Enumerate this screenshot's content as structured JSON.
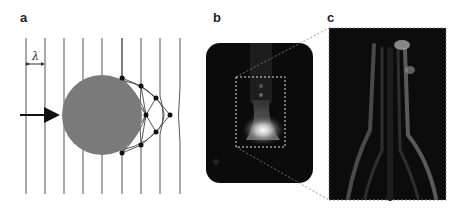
{
  "figure": {
    "panels": [
      {
        "label": "a",
        "description": "Plane wavefronts diffracting around a circular obstacle",
        "wavelength_symbol": "λ"
      },
      {
        "label": "b",
        "description": "Fluorescence image with dashed region of interest"
      },
      {
        "label": "c",
        "description": "Magnified reconstruction of dashed region"
      }
    ],
    "colors": {
      "line": "#555555",
      "obstacle": "#7a7a7a",
      "dot": "#111111",
      "image_bg": "#0b0b0b",
      "dashed": "#dddddd",
      "connector": "#888888"
    }
  }
}
